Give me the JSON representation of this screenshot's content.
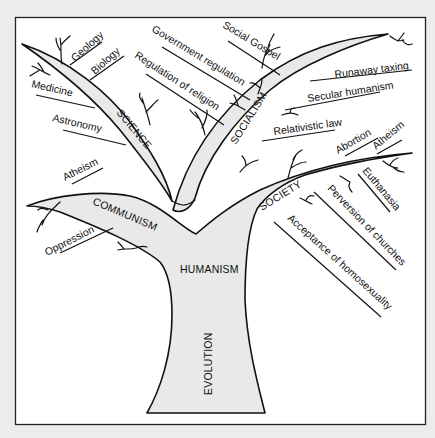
{
  "diagram": {
    "type": "tree",
    "colors": {
      "page_background": "#ececec",
      "frame_background": "#ffffff",
      "frame_border": "#222222",
      "tree_fill": "#e9e9e9",
      "line": "#111111",
      "text": "#111111"
    },
    "trunk": {
      "root": "EVOLUTION",
      "upper": "HUMANISM"
    },
    "branches": [
      {
        "name": "SCIENCE",
        "leaves": [
          "Geology",
          "Biology",
          "Medicine",
          "Astronomy"
        ]
      },
      {
        "name": "COMMUNISM",
        "leaves": [
          "Atheism",
          "Oppression"
        ]
      },
      {
        "name": "SOCIALISM",
        "leaves": [
          "Government regulation",
          "Regulation of religion",
          "Social Gospel",
          "Runaway taxing",
          "Secular humanism",
          "Relativistic law"
        ]
      },
      {
        "name": "SOCIETY",
        "leaves": [
          "Abortion",
          "Atheism",
          "Euthanasia",
          "Perversion of churches",
          "Acceptance of homosexuality"
        ]
      }
    ]
  }
}
